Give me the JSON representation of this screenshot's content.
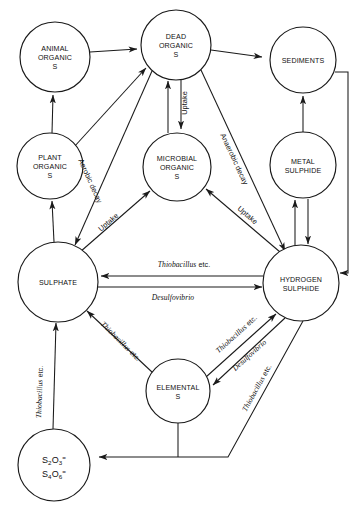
{
  "diagram": {
    "type": "cycle-flow-diagram",
    "background_color": "#ffffff",
    "line_color": "#1a1a1a",
    "width": 361,
    "height": 506
  },
  "nodes": [
    {
      "id": "animal-organic-s",
      "lines": [
        "ANIMAL",
        "ORGANIC",
        "S"
      ],
      "cx": 55,
      "cy": 57,
      "r": 35
    },
    {
      "id": "dead-organic-s",
      "lines": [
        "DEAD",
        "ORGANIC",
        "S"
      ],
      "cx": 176,
      "cy": 45,
      "r": 35
    },
    {
      "id": "sediments",
      "lines": [
        "SEDIMENTS"
      ],
      "cx": 303,
      "cy": 60,
      "r": 33
    },
    {
      "id": "plant-organic-s",
      "lines": [
        "PLANT",
        "ORGANIC",
        "S"
      ],
      "cx": 50,
      "cy": 166,
      "r": 33
    },
    {
      "id": "microbial-organic-s",
      "lines": [
        "MICROBIAL",
        "ORGANIC",
        "S"
      ],
      "cx": 177,
      "cy": 167,
      "r": 34
    },
    {
      "id": "metal-sulphide",
      "lines": [
        "METAL",
        "SULPHIDE"
      ],
      "cx": 303,
      "cy": 165,
      "r": 33
    },
    {
      "id": "sulphate",
      "lines": [
        "SULPHATE"
      ],
      "cx": 58,
      "cy": 282,
      "r": 40
    },
    {
      "id": "hydrogen-sulphide",
      "lines": [
        "HYDROGEN",
        "SULPHIDE"
      ],
      "cx": 301,
      "cy": 283,
      "r": 38
    },
    {
      "id": "elemental-s",
      "lines": [
        "ELEMENTAL",
        "S"
      ],
      "cx": 178,
      "cy": 391,
      "r": 32
    },
    {
      "id": "thiosulphate-tetrathionate",
      "lines": [
        "S2O3=",
        "S4O6="
      ],
      "formula": [
        {
          "el": "S",
          "sub": "2",
          "el2": "O",
          "sub2": "3",
          "sup": "="
        },
        {
          "el": "S",
          "sub": "4",
          "el2": "O",
          "sub2": "6",
          "sup": "="
        }
      ],
      "cx": 54,
      "cy": 465,
      "r": 36
    }
  ],
  "edges": [
    {
      "id": "animal-to-dead",
      "from": "animal-organic-s",
      "to": "dead-organic-s",
      "label": ""
    },
    {
      "id": "plant-to-animal",
      "from": "plant-organic-s",
      "to": "animal-organic-s",
      "label": ""
    },
    {
      "id": "plant-to-dead",
      "from": "plant-organic-s",
      "to": "dead-organic-s",
      "label": ""
    },
    {
      "id": "dead-to-sediments",
      "from": "dead-organic-s",
      "to": "sediments",
      "label": ""
    },
    {
      "id": "dead-to-microbial-uptake",
      "from": "dead-organic-s",
      "to": "microbial-organic-s",
      "label": "Uptake"
    },
    {
      "id": "microbial-to-dead",
      "from": "microbial-organic-s",
      "to": "dead-organic-s",
      "label": ""
    },
    {
      "id": "dead-to-hydrogen-sulphide",
      "from": "dead-organic-s",
      "to": "hydrogen-sulphide",
      "label": "Anaerobic decay"
    },
    {
      "id": "dead-to-sulphate-aerobic",
      "from": "dead-organic-s",
      "to": "sulphate",
      "label": "Aerobic decay"
    },
    {
      "id": "sulphate-to-microbial-uptake",
      "from": "sulphate",
      "to": "microbial-organic-s",
      "label": "Uptake"
    },
    {
      "id": "hydrogen-sulphide-to-microbial-uptake",
      "from": "hydrogen-sulphide",
      "to": "microbial-organic-s",
      "label": "Uptake"
    },
    {
      "id": "sulphate-to-plant",
      "from": "sulphate",
      "to": "plant-organic-s",
      "label": ""
    },
    {
      "id": "metal-sulphide-to-sediments",
      "from": "metal-sulphide",
      "to": "sediments",
      "label": ""
    },
    {
      "id": "hydrogen-sulphide-to-metal-sulphide",
      "from": "hydrogen-sulphide",
      "to": "metal-sulphide",
      "label": ""
    },
    {
      "id": "metal-sulphide-to-hydrogen-sulphide",
      "from": "metal-sulphide",
      "to": "hydrogen-sulphide",
      "label": ""
    },
    {
      "id": "sediments-to-hydrogen-sulphide",
      "from": "sediments",
      "to": "hydrogen-sulphide",
      "label": ""
    },
    {
      "id": "hydrogen-sulphide-to-sulphate",
      "from": "hydrogen-sulphide",
      "to": "sulphate",
      "label_italic": "Thiobacillus",
      "label_roman": " etc."
    },
    {
      "id": "sulphate-to-hydrogen-sulphide",
      "from": "sulphate",
      "to": "hydrogen-sulphide",
      "label_italic": "Desulfovibrio",
      "label_roman": ""
    },
    {
      "id": "elemental-to-sulphate",
      "from": "elemental-s",
      "to": "sulphate",
      "label_italic": "Thiobacillus",
      "label_roman": " etc."
    },
    {
      "id": "elemental-to-hydrogen-sulphide",
      "from": "elemental-s",
      "to": "hydrogen-sulphide",
      "label_italic": "Thiobacillus",
      "label_roman": " etc."
    },
    {
      "id": "hydrogen-sulphide-to-elemental",
      "from": "hydrogen-sulphide",
      "to": "elemental-s",
      "label_italic": "Desulfovibrio",
      "label_roman": ""
    },
    {
      "id": "thiosulphate-to-sulphate",
      "from": "thiosulphate-tetrathionate",
      "to": "sulphate",
      "label_italic": "Thiobacillus",
      "label_roman": " etc."
    },
    {
      "id": "hydrogen-sulphide-to-thiosulphate",
      "from": "hydrogen-sulphide",
      "to": "thiosulphate-tetrathionate",
      "label_italic": "Thiobacillus",
      "label_roman": " etc."
    },
    {
      "id": "elemental-to-thiosulphate",
      "from": "elemental-s",
      "to": "thiosulphate-tetrathionate",
      "label": ""
    }
  ],
  "edge_labels": [
    {
      "id": "label-uptake-dead-microbial",
      "text": "Uptake",
      "style": "upright",
      "x": 187,
      "y": 103,
      "rotate": -90
    },
    {
      "id": "label-anaerobic-decay",
      "text": "Anaerobic decay",
      "style": "upright",
      "x": 232,
      "y": 160,
      "rotate": 57
    },
    {
      "id": "label-aerobic-decay",
      "text": "Aerobic decay",
      "style": "upright",
      "x": 90,
      "y": 180,
      "rotate": 68
    },
    {
      "id": "label-uptake-sulphate-microbial",
      "text": "Uptake",
      "style": "upright",
      "x": 110,
      "y": 222,
      "rotate": -40
    },
    {
      "id": "label-uptake-hs-microbial",
      "text": "Uptake",
      "style": "upright",
      "x": 246,
      "y": 215,
      "rotate": 51
    },
    {
      "id": "label-thiobacillus-hs-sulphate",
      "italic": "Thiobacillus",
      "roman": " etc.",
      "x": 184,
      "y": 265,
      "rotate": 0
    },
    {
      "id": "label-desulfovibrio-sulphate-hs",
      "italic": "Desulfovibrio",
      "roman": "",
      "x": 173,
      "y": 296,
      "rotate": 0
    },
    {
      "id": "label-thiobacillus-elemental-sulphate",
      "italic": "Thiobacillus",
      "roman": " etc.",
      "x": 119,
      "y": 343,
      "rotate": 47
    },
    {
      "id": "label-thiobacillus-vertical",
      "italic": "Thiobacillus",
      "roman": " etc.",
      "x": 43,
      "y": 392,
      "rotate": -82
    },
    {
      "id": "label-thiobacillus-elemental-hs",
      "italic": "Thiobacillus",
      "roman": " etc.",
      "x": 240,
      "y": 338,
      "rotate": -38
    },
    {
      "id": "label-desulfovibrio-hs-elemental",
      "italic": "Desulfovibrio",
      "roman": "",
      "x": 248,
      "y": 356,
      "rotate": -40
    },
    {
      "id": "label-thiobacillus-hs-thiosulphate",
      "italic": "Thiobacillus",
      "roman": " etc.",
      "x": 259,
      "y": 388,
      "rotate": -57
    }
  ]
}
